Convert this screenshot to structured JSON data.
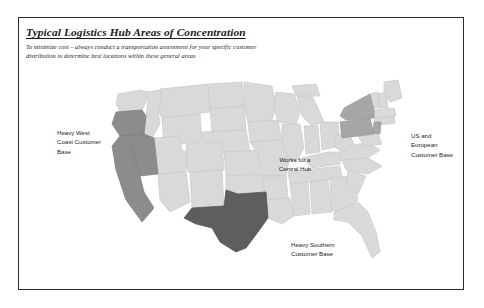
{
  "slide": {
    "title": "Typical Logistics Hub Areas of Concentration",
    "subtitle_line1": "To minimize cost – always conduct a transportation assessment for your specific customer",
    "subtitle_line2": "distribution to determine best locations within these general areas"
  },
  "callouts": {
    "west": "Heavy West\nCoast Customer\nBase",
    "east": "US and\nEuropean\nCustomer Base",
    "central": "Works for a\nCentral Hub",
    "south": "Heavy Southern\nCustomer Base"
  },
  "map": {
    "icon_name": "us-map",
    "base_fill": "#d9d9d9",
    "base_stroke": "#c6c6c6",
    "highlight_west_fill": "#8c8c8c",
    "highlight_texas_fill": "#5e5e5e",
    "highlight_northeast_fill": "#a6a6a6",
    "regions": [
      {
        "name": "west-coast-region",
        "label": "Heavy West Coast Customer Base",
        "shade": "#8c8c8c"
      },
      {
        "name": "central-region",
        "label": "Works for a Central Hub",
        "shade": "#d9d9d9"
      },
      {
        "name": "texas-region",
        "label": "Heavy Southern Customer Base",
        "shade": "#5e5e5e"
      },
      {
        "name": "northeast-region",
        "label": "US and European Customer Base",
        "shade": "#a6a6a6"
      }
    ]
  },
  "frame": {
    "border_color": "#2b2b2b"
  }
}
